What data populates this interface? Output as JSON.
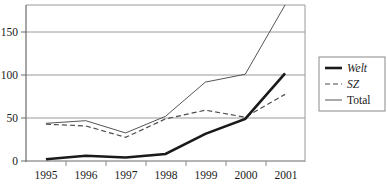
{
  "chart_data": {
    "type": "line",
    "title": "",
    "xlabel": "",
    "ylabel": "",
    "categories": [
      "1995",
      "1996",
      "1997",
      "1998",
      "1999",
      "2000",
      "2001"
    ],
    "x": [
      1995,
      1996,
      1997,
      1998,
      1999,
      2000,
      2001
    ],
    "ylim": [
      0,
      178
    ],
    "y_ticks": [
      0,
      50,
      100,
      150
    ],
    "y_tick_labels": [
      "0",
      "50",
      "100",
      "150"
    ],
    "grid": true,
    "grid_axis": "y",
    "legend_position": "right",
    "series": [
      {
        "name": "Welt",
        "style": "thick-solid",
        "color": "#1a1a1a",
        "italic_label": true,
        "values": [
          2,
          6,
          4,
          8,
          31,
          48,
          100
        ]
      },
      {
        "name": "SZ",
        "style": "dashed",
        "color": "#4d4d4d",
        "italic_label": true,
        "values": [
          42,
          40,
          27,
          48,
          58,
          50,
          76
        ]
      },
      {
        "name": "Total",
        "style": "thin-solid",
        "color": "#555555",
        "italic_label": false,
        "values": [
          43,
          46,
          32,
          51,
          90,
          99,
          178
        ]
      }
    ]
  },
  "axes": {
    "y_tick_labels": [
      "150",
      "100",
      "50",
      "0"
    ],
    "x_tick_labels": [
      "1995",
      "1996",
      "1997",
      "1998",
      "1999",
      "2000",
      "2001"
    ]
  },
  "legend": {
    "entries": [
      {
        "label": "Welt",
        "swatch": "thick-solid-line-swatch"
      },
      {
        "label": "SZ",
        "swatch": "dashed-line-swatch"
      },
      {
        "label": "Total",
        "swatch": "thin-solid-line-swatch"
      }
    ]
  }
}
